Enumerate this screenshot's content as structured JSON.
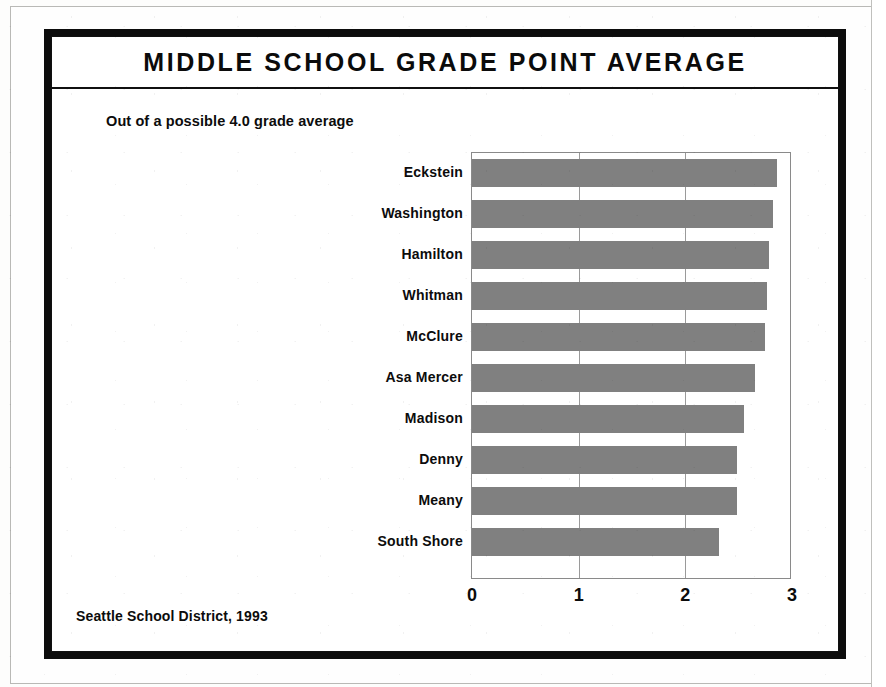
{
  "figure": {
    "title": "MIDDLE SCHOOL GRADE POINT AVERAGE",
    "subtitle": "Out of a possible 4.0 grade average",
    "source_note": "Seattle School District, 1993"
  },
  "style": {
    "bar_fill": "#808080",
    "frame_color": "#0c0c0c",
    "grid_color": "#9a9a9a",
    "text_color": "#0c0c0c",
    "page_background": "#fefefe"
  },
  "chart_data": {
    "type": "bar",
    "orientation": "horizontal",
    "title": "MIDDLE SCHOOL GRADE POINT AVERAGE",
    "subtitle": "Out of a possible 4.0 grade average",
    "xlabel": "",
    "ylabel": "",
    "xlim": [
      0,
      3
    ],
    "xticks": [
      0,
      1,
      2,
      3
    ],
    "xtick_labels": [
      "0",
      "1",
      "2",
      "3"
    ],
    "grid": true,
    "grid_axis": "x",
    "legend": false,
    "legend_position": "none",
    "scale_note": "Out of a possible 4.0 grade average",
    "source": "Seattle School District, 1993",
    "categories": [
      "Eckstein",
      "Washington",
      "Hamilton",
      "Whitman",
      "McClure",
      "Asa Mercer",
      "Madison",
      "Denny",
      "Meany",
      "South Shore"
    ],
    "values": [
      2.86,
      2.82,
      2.78,
      2.77,
      2.75,
      2.65,
      2.55,
      2.48,
      2.48,
      2.32
    ],
    "bars": [
      {
        "category": "Eckstein",
        "value": 2.86
      },
      {
        "category": "Washington",
        "value": 2.82
      },
      {
        "category": "Hamilton",
        "value": 2.78
      },
      {
        "category": "Whitman",
        "value": 2.77
      },
      {
        "category": "McClure",
        "value": 2.75
      },
      {
        "category": "Asa Mercer",
        "value": 2.65
      },
      {
        "category": "Madison",
        "value": 2.55
      },
      {
        "category": "Denny",
        "value": 2.48
      },
      {
        "category": "Meany",
        "value": 2.48
      },
      {
        "category": "South Shore",
        "value": 2.32
      }
    ]
  }
}
